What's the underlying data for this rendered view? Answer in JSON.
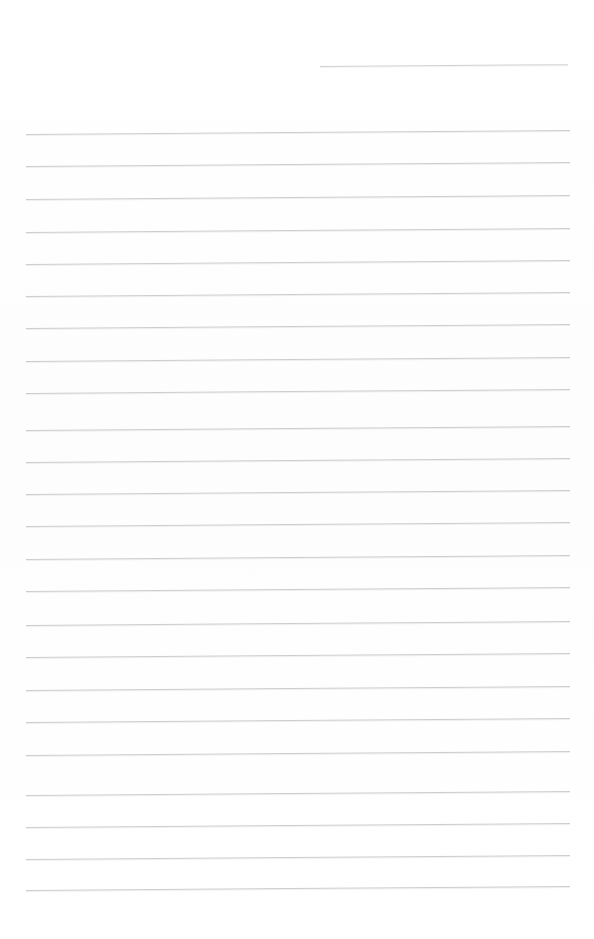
{
  "document": {
    "type": "scanned-lined-notepad-page",
    "title": "Lined notepad page",
    "page_width": 594,
    "page_height": 939,
    "background_color": "#fefefe",
    "rule_color": "#c9cbcd",
    "content_text": "",
    "is_blank": true
  },
  "layout": {
    "left_margin_x": 26,
    "right_margin_x": 570,
    "line_spacing": 32.4,
    "tilt_degrees": -0.42,
    "first_body_line_y": 134,
    "last_body_line_y": 890,
    "top_margin_height": 55,
    "bottom_margin_height": 49
  },
  "header_rule": {
    "name": "header-rule",
    "x": 320,
    "y": 66,
    "width": 248,
    "color": "#cdcfd1"
  },
  "rules": [
    {
      "index": 1,
      "y": 134,
      "x": 26,
      "width": 544
    },
    {
      "index": 2,
      "y": 166,
      "x": 26,
      "width": 544
    },
    {
      "index": 3,
      "y": 199,
      "x": 26,
      "width": 544
    },
    {
      "index": 4,
      "y": 232,
      "x": 26,
      "width": 544
    },
    {
      "index": 5,
      "y": 264,
      "x": 26,
      "width": 544
    },
    {
      "index": 6,
      "y": 296,
      "x": 26,
      "width": 544
    },
    {
      "index": 7,
      "y": 328,
      "x": 26,
      "width": 544
    },
    {
      "index": 8,
      "y": 361,
      "x": 26,
      "width": 544
    },
    {
      "index": 9,
      "y": 393,
      "x": 26,
      "width": 544
    },
    {
      "index": 10,
      "y": 430,
      "x": 26,
      "width": 544
    },
    {
      "index": 11,
      "y": 462,
      "x": 26,
      "width": 544
    },
    {
      "index": 12,
      "y": 494,
      "x": 26,
      "width": 544
    },
    {
      "index": 13,
      "y": 526,
      "x": 26,
      "width": 544
    },
    {
      "index": 14,
      "y": 559,
      "x": 26,
      "width": 544
    },
    {
      "index": 15,
      "y": 591,
      "x": 26,
      "width": 544
    },
    {
      "index": 16,
      "y": 625,
      "x": 26,
      "width": 544
    },
    {
      "index": 17,
      "y": 657,
      "x": 26,
      "width": 544
    },
    {
      "index": 18,
      "y": 690,
      "x": 26,
      "width": 544
    },
    {
      "index": 19,
      "y": 722,
      "x": 26,
      "width": 544
    },
    {
      "index": 20,
      "y": 755,
      "x": 26,
      "width": 544
    },
    {
      "index": 21,
      "y": 795,
      "x": 26,
      "width": 544
    },
    {
      "index": 22,
      "y": 827,
      "x": 26,
      "width": 544
    },
    {
      "index": 23,
      "y": 859,
      "x": 26,
      "width": 544
    },
    {
      "index": 24,
      "y": 890,
      "x": 26,
      "width": 544
    }
  ]
}
